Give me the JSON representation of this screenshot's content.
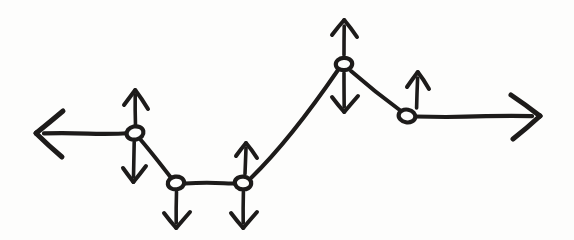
{
  "figure": {
    "title": "Hand-drawn node path with vertical force arrows",
    "style": "hand-drawn pen sketch",
    "background_color": "#fdfdfc",
    "ink_color": "#1d1b1a",
    "width": 574,
    "height": 240
  },
  "chart_data": {
    "type": "line",
    "title": "Hand-drawn node path with vertical force arrows",
    "xlabel": "",
    "ylabel": "",
    "grid": false,
    "legend": null,
    "xlim": [
      0,
      574
    ],
    "ylim": [
      240,
      0
    ],
    "note": "Pixel coordinates, y increases downward as in image space",
    "series": [
      {
        "name": "node-path",
        "x": [
          135,
          176,
          243,
          344,
          407
        ],
        "y": [
          133,
          183,
          183,
          64,
          116
        ]
      }
    ],
    "nodes": [
      {
        "id": "node-1",
        "x": 135,
        "y": 133,
        "label": ""
      },
      {
        "id": "node-2",
        "x": 176,
        "y": 183,
        "label": ""
      },
      {
        "id": "node-3",
        "x": 243,
        "y": 183,
        "label": ""
      },
      {
        "id": "node-4",
        "x": 344,
        "y": 64,
        "label": ""
      },
      {
        "id": "node-5",
        "x": 407,
        "y": 116,
        "label": ""
      }
    ],
    "force_arrows": [
      {
        "id": "force-up-node-1",
        "node": "node-1",
        "direction": "up",
        "tip_x": 135,
        "tip_y": 90,
        "tail_x": 135,
        "tail_y": 126
      },
      {
        "id": "force-down-node-1",
        "node": "node-1",
        "direction": "down",
        "tip_x": 133,
        "tip_y": 182,
        "tail_x": 134,
        "tail_y": 142
      },
      {
        "id": "force-down-node-2",
        "node": "node-2",
        "direction": "down",
        "tip_x": 176,
        "tip_y": 228,
        "tail_x": 176,
        "tail_y": 192
      },
      {
        "id": "force-up-node-3",
        "node": "node-3",
        "direction": "up",
        "tip_x": 246,
        "tip_y": 143,
        "tail_x": 245,
        "tail_y": 174
      },
      {
        "id": "force-down-node-3",
        "node": "node-3",
        "direction": "down",
        "tip_x": 243,
        "tip_y": 228,
        "tail_x": 243,
        "tail_y": 192
      },
      {
        "id": "force-up-node-4",
        "node": "node-4",
        "direction": "up",
        "tip_x": 344,
        "tip_y": 20,
        "tail_x": 344,
        "tail_y": 55
      },
      {
        "id": "force-down-node-4",
        "node": "node-4",
        "direction": "down",
        "tip_x": 344,
        "tip_y": 112,
        "tail_x": 344,
        "tail_y": 73
      },
      {
        "id": "force-up-node-5",
        "node": "node-5",
        "direction": "up",
        "tip_x": 418,
        "tip_y": 72,
        "tail_x": 417,
        "tail_y": 108
      }
    ],
    "axis_arrows": [
      {
        "id": "axis-left",
        "direction": "left",
        "from_x": 135,
        "from_y": 133,
        "tip_x": 36,
        "tip_y": 133
      },
      {
        "id": "axis-right",
        "direction": "right",
        "from_x": 407,
        "from_y": 116,
        "tip_x": 540,
        "tip_y": 116
      }
    ],
    "segments": [
      {
        "id": "segment-1-2",
        "from": "node-1",
        "to": "node-2"
      },
      {
        "id": "segment-2-3",
        "from": "node-2",
        "to": "node-3"
      },
      {
        "id": "segment-3-4",
        "from": "node-3",
        "to": "node-4"
      },
      {
        "id": "segment-4-5",
        "from": "node-4",
        "to": "node-5"
      }
    ]
  }
}
